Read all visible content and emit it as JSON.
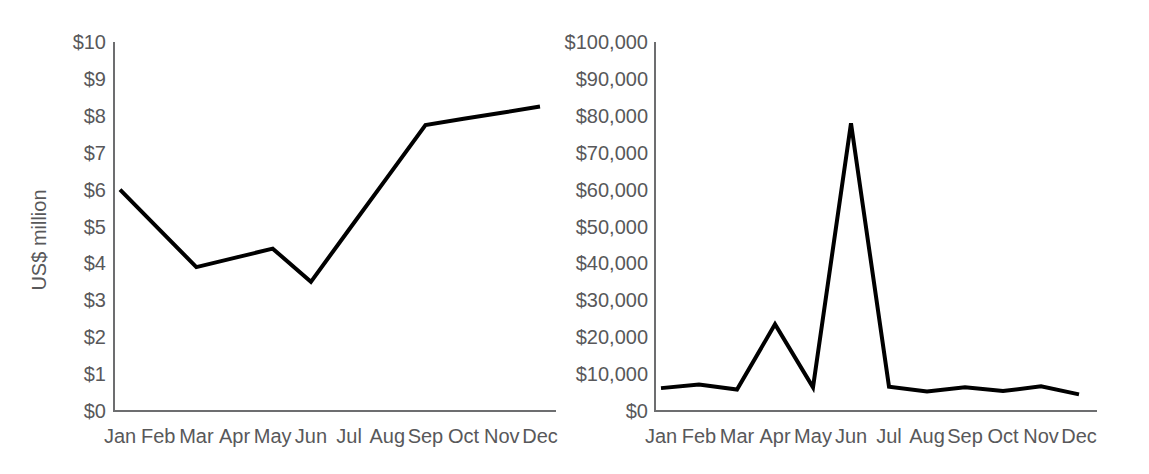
{
  "chart_data": [
    {
      "id": "left",
      "type": "line",
      "title": "",
      "xlabel": "",
      "ylabel": "US$ million",
      "categories": [
        "Jan",
        "Feb",
        "Mar",
        "Apr",
        "May",
        "Jun",
        "Jul",
        "Aug",
        "Sep",
        "Oct",
        "Nov",
        "Dec"
      ],
      "ytick_labels": [
        "$10",
        "$9",
        "$8",
        "$7",
        "$6",
        "$5",
        "$4",
        "$3",
        "$2",
        "$1",
        "$0"
      ],
      "ytick_values": [
        10,
        9,
        8,
        7,
        6,
        5,
        4,
        3,
        2,
        1,
        0
      ],
      "ylim": [
        0,
        10
      ],
      "grid": false,
      "legend": "none",
      "series": [
        {
          "name": "US$ million",
          "color": "#000000",
          "values": [
            6.0,
            4.95,
            3.9,
            4.15,
            4.4,
            3.5,
            4.92,
            6.33,
            7.75,
            7.92,
            8.08,
            8.25
          ]
        }
      ],
      "vertices": [
        {
          "category": "Jan",
          "value": 6.0
        },
        {
          "category": "Mar",
          "value": 3.9
        },
        {
          "category": "May",
          "value": 4.4
        },
        {
          "category": "Jun",
          "value": 3.5
        },
        {
          "category": "Sep",
          "value": 7.75
        },
        {
          "category": "Dec",
          "value": 8.25
        }
      ]
    },
    {
      "id": "right",
      "type": "line",
      "title": "",
      "xlabel": "",
      "ylabel": "",
      "categories": [
        "Jan",
        "Feb",
        "Mar",
        "Apr",
        "May",
        "Jun",
        "Jul",
        "Aug",
        "Sep",
        "Oct",
        "Nov",
        "Dec"
      ],
      "ytick_labels": [
        "$100,000",
        "$90,000",
        "$80,000",
        "$70,000",
        "$60,000",
        "$50,000",
        "$40,000",
        "$30,000",
        "$20,000",
        "$10,000",
        "$0"
      ],
      "ytick_values": [
        100000,
        90000,
        80000,
        70000,
        60000,
        50000,
        40000,
        30000,
        20000,
        10000,
        0
      ],
      "ylim": [
        0,
        100000
      ],
      "grid": false,
      "legend": "none",
      "series": [
        {
          "name": "Amount",
          "color": "#000000",
          "values": [
            6200,
            7200,
            5800,
            23500,
            6400,
            78000,
            6600,
            5300,
            6400,
            5400,
            6700,
            4500
          ]
        }
      ],
      "annotations": [
        {
          "label": "secondary peak",
          "category": "Apr",
          "value": 23500
        },
        {
          "label": "primary peak",
          "category": "Jun",
          "value": 78000
        }
      ]
    }
  ],
  "figure": {
    "background": "#ffffff",
    "line_color": "#000000",
    "text_color": "#58585a",
    "axis_color": "#6d6e70"
  }
}
